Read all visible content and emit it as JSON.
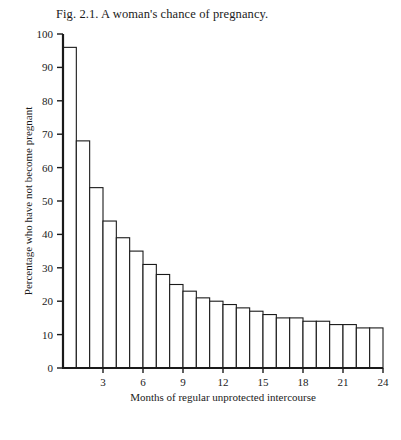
{
  "figure": {
    "caption": "Fig. 2.1. A woman's chance of pregnancy."
  },
  "chart_data": {
    "type": "bar",
    "title": "Fig. 2.1. A woman's chance of pregnancy.",
    "xlabel": "Months of regular unprotected intercourse",
    "ylabel": "Percentage who have not become pregnant",
    "categories": [
      1,
      2,
      3,
      4,
      5,
      6,
      7,
      8,
      9,
      10,
      11,
      12,
      13,
      14,
      15,
      16,
      17,
      18,
      19,
      20,
      21,
      22,
      23,
      24
    ],
    "values": [
      96,
      68,
      54,
      44,
      39,
      35,
      31,
      28,
      25,
      23,
      21,
      20,
      19,
      18,
      17,
      16,
      15,
      15,
      14,
      14,
      13,
      13,
      12,
      12
    ],
    "xlim": [
      0,
      24
    ],
    "ylim": [
      0,
      100
    ],
    "xticks": [
      3,
      6,
      9,
      12,
      15,
      18,
      21,
      24
    ],
    "xtick_labels": [
      "3",
      "6",
      "9",
      "12",
      "15",
      "18",
      "21",
      "24"
    ],
    "yticks": [
      0,
      10,
      20,
      30,
      40,
      50,
      60,
      70,
      80,
      90,
      100
    ],
    "ytick_labels": [
      "0",
      "10",
      "20",
      "30",
      "40",
      "50",
      "60",
      "70",
      "80",
      "90",
      "100"
    ],
    "grid": false,
    "legend": false,
    "bar_fill": "#ffffff",
    "bar_edge": "#1a1a1a",
    "axis_color": "#1a1a1a"
  }
}
